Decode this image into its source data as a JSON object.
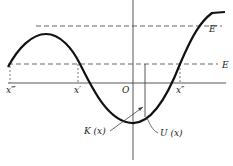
{
  "diagram": {
    "labels": {
      "e_prime": "E′",
      "e": "E",
      "x_triple": "x‴",
      "x_prime": "x′",
      "origin": "O",
      "x_double": "x″",
      "kinetic": "K (x)",
      "potential": "U (x)"
    },
    "colors": {
      "curve": "#111111",
      "axis": "#444444",
      "dashed": "#555555"
    }
  }
}
